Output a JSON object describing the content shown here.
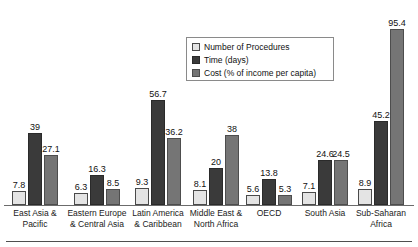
{
  "chart_data": {
    "type": "bar",
    "title": "",
    "subtitle": "",
    "xlabel": "",
    "ylabel": "",
    "ylim": [
      0,
      100
    ],
    "grid": false,
    "legend_position": "top-center",
    "categories": [
      "East Asia & Pacific",
      "Eastern Europe & Central Asia",
      "Latin America & Caribbean",
      "Middle East & North Africa",
      "OECD",
      "South Asia",
      "Sub-Saharan Africa"
    ],
    "category_lines": [
      [
        "East Asia &",
        "Pacific"
      ],
      [
        "Eastern Europe",
        "& Central Asia"
      ],
      [
        "Latin America",
        "& Caribbean"
      ],
      [
        "Middle East &",
        "North Africa"
      ],
      [
        "OECD",
        ""
      ],
      [
        "South Asia",
        ""
      ],
      [
        "Sub-Saharan",
        "Africa"
      ]
    ],
    "series": [
      {
        "name": "Number of Procedures",
        "color": "#e4e4e4",
        "values": [
          7.8,
          6.3,
          9.3,
          8.1,
          5.6,
          7.1,
          8.9
        ],
        "labels": [
          "7.8",
          "6.3",
          "9.3",
          "8.1",
          "5.6",
          "7.1",
          "8.9"
        ]
      },
      {
        "name": "Time (days)",
        "color": "#3a3a3a",
        "values": [
          39,
          16.3,
          56.7,
          20,
          13.8,
          24.6,
          45.2
        ],
        "labels": [
          "39",
          "16.3",
          "56.7",
          "20",
          "13.8",
          "24.6",
          "45.2"
        ]
      },
      {
        "name": "Cost (% of income per capita)",
        "color": "#757575",
        "values": [
          27.1,
          8.5,
          36.2,
          38,
          5.3,
          24.5,
          95.4
        ],
        "labels": [
          "27.1",
          "8.5",
          "36.2",
          "38",
          "5.3",
          "24.5",
          "95.4"
        ]
      }
    ]
  },
  "legend": {
    "items": [
      {
        "label": "Number of Procedures",
        "color": "#e4e4e4"
      },
      {
        "label": "Time (days)",
        "color": "#3a3a3a"
      },
      {
        "label": "Cost (% of income per capita)",
        "color": "#757575"
      }
    ]
  }
}
